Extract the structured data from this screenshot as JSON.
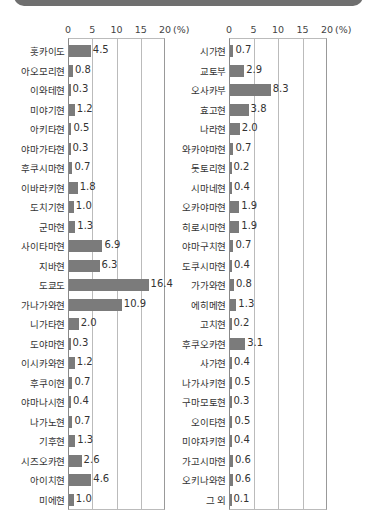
{
  "chart_data": [
    {
      "type": "bar",
      "orientation": "horizontal",
      "title": "",
      "xlabel": "(%)",
      "ylabel": "",
      "xlim": [
        0,
        20
      ],
      "xticks": [
        "0",
        "5",
        "10",
        "15",
        "20"
      ],
      "unit": "(%)",
      "grid": true,
      "categories": [
        "홋카이도",
        "아오모리현",
        "이와테현",
        "미야기현",
        "아키타현",
        "야마가타현",
        "후쿠시마현",
        "이바라키현",
        "도치기현",
        "군마현",
        "사이타마현",
        "지바현",
        "도쿄도",
        "가나가와현",
        "니가타현",
        "도야마현",
        "이시카와현",
        "후쿠이현",
        "야마나시현",
        "나가노현",
        "기후현",
        "시즈오카현",
        "아이치현",
        "미에현"
      ],
      "values": [
        4.5,
        0.8,
        0.3,
        1.2,
        0.5,
        0.3,
        0.7,
        1.8,
        1.0,
        1.3,
        6.9,
        6.3,
        16.4,
        10.9,
        2.0,
        0.3,
        1.2,
        0.7,
        0.4,
        0.7,
        1.3,
        2.6,
        4.6,
        1.0
      ],
      "labels": [
        "4.5",
        "0.8",
        "0.3",
        "1.2",
        "0.5",
        "0.3",
        "0.7",
        "1.8",
        "1.0",
        "1.3",
        "6.9",
        "6.3",
        "16.4",
        "10.9",
        "2.0",
        "0.3",
        "1.2",
        "0.7",
        "0.4",
        "0.7",
        "1.3",
        "2.6",
        "4.6",
        "1.0"
      ],
      "bar_color": "#7b7b7b"
    },
    {
      "type": "bar",
      "orientation": "horizontal",
      "title": "",
      "xlabel": "(%)",
      "ylabel": "",
      "xlim": [
        0,
        20
      ],
      "xticks": [
        "0",
        "5",
        "10",
        "15",
        "20"
      ],
      "unit": "(%)",
      "grid": true,
      "categories": [
        "시가현",
        "교토부",
        "오사카부",
        "효고현",
        "나라현",
        "와카야마현",
        "돗토리현",
        "시마네현",
        "오카야마현",
        "히로시마현",
        "야마구치현",
        "도쿠시마현",
        "가가와현",
        "에히메현",
        "고치현",
        "후쿠오카현",
        "사가현",
        "나가사키현",
        "구마모토현",
        "오이타현",
        "미야자키현",
        "가고시마현",
        "오키나와현",
        "그 외"
      ],
      "values": [
        0.7,
        2.9,
        8.3,
        3.8,
        2.0,
        0.7,
        0.2,
        0.4,
        1.9,
        1.9,
        0.7,
        0.4,
        0.8,
        1.3,
        0.2,
        3.1,
        0.4,
        0.5,
        0.3,
        0.5,
        0.4,
        0.6,
        0.6,
        0.1
      ],
      "labels": [
        "0.7",
        "2.9",
        "8.3",
        "3.8",
        "2.0",
        "0.7",
        "0.2",
        "0.4",
        "1.9",
        "1.9",
        "0.7",
        "0.4",
        "0.8",
        "1.3",
        "0.2",
        "3.1",
        "0.4",
        "0.5",
        "0.3",
        "0.5",
        "0.4",
        "0.6",
        "0.6",
        "0.1"
      ],
      "bar_color": "#7b7b7b"
    }
  ]
}
